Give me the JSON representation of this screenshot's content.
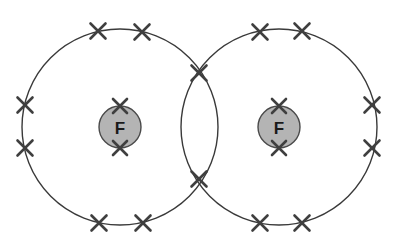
{
  "diagram": {
    "molecule": "F2",
    "background_color": "#ffffff",
    "canvas": {
      "width": 397,
      "height": 247
    },
    "shell_stroke_color": "#3a3a3a",
    "atom_fill_color": "#b4b4b4",
    "atom_stroke_color": "#4a4a4a",
    "electron_color": "#3f3f3f",
    "electron_symbol": "x",
    "atoms": [
      {
        "id": "atom-left",
        "label": "F",
        "cx": 120,
        "cy": 127,
        "r": 21,
        "shell_r": 98
      },
      {
        "id": "atom-right",
        "label": "F",
        "cx": 279,
        "cy": 127,
        "r": 21,
        "shell_r": 98
      }
    ],
    "electrons": [
      {
        "id": "e-left-top-1",
        "x": 98,
        "y": 31,
        "size": 15,
        "group": "left-shell"
      },
      {
        "id": "e-left-top-2",
        "x": 142,
        "y": 32,
        "size": 15,
        "group": "left-shell"
      },
      {
        "id": "e-left-side-1",
        "x": 25,
        "y": 105,
        "size": 15,
        "group": "left-shell"
      },
      {
        "id": "e-left-side-2",
        "x": 25,
        "y": 148,
        "size": 15,
        "group": "left-shell"
      },
      {
        "id": "e-left-bot-1",
        "x": 99,
        "y": 223,
        "size": 15,
        "group": "left-shell"
      },
      {
        "id": "e-left-bot-2",
        "x": 143,
        "y": 223,
        "size": 15,
        "group": "left-shell"
      },
      {
        "id": "e-left-core-top",
        "x": 120,
        "y": 106,
        "size": 14,
        "group": "left-core"
      },
      {
        "id": "e-left-core-bot",
        "x": 120,
        "y": 148,
        "size": 14,
        "group": "left-core"
      },
      {
        "id": "e-right-top-1",
        "x": 260,
        "y": 32,
        "size": 15,
        "group": "right-shell"
      },
      {
        "id": "e-right-top-2",
        "x": 302,
        "y": 31,
        "size": 15,
        "group": "right-shell"
      },
      {
        "id": "e-right-side-1",
        "x": 372,
        "y": 105,
        "size": 15,
        "group": "right-shell"
      },
      {
        "id": "e-right-side-2",
        "x": 372,
        "y": 148,
        "size": 15,
        "group": "right-shell"
      },
      {
        "id": "e-right-bot-1",
        "x": 260,
        "y": 223,
        "size": 15,
        "group": "right-shell"
      },
      {
        "id": "e-right-bot-2",
        "x": 302,
        "y": 223,
        "size": 15,
        "group": "right-shell"
      },
      {
        "id": "e-right-core-top",
        "x": 279,
        "y": 106,
        "size": 14,
        "group": "right-core"
      },
      {
        "id": "e-right-core-bot",
        "x": 279,
        "y": 148,
        "size": 14,
        "group": "right-core"
      },
      {
        "id": "e-shared-top",
        "x": 199,
        "y": 73,
        "size": 15,
        "group": "shared-pair"
      },
      {
        "id": "e-shared-bot",
        "x": 199,
        "y": 179,
        "size": 15,
        "group": "shared-pair"
      }
    ]
  }
}
